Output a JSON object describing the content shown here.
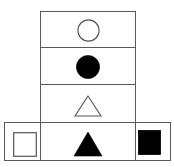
{
  "figure": {
    "canvas": {
      "width": 174,
      "height": 167,
      "background": "#ffffff"
    },
    "stroke_color": "#5a5a5a",
    "shape_outline_color": "#555555",
    "shape_fill_color": "#000000",
    "column": {
      "name": "vertical-column",
      "cells": [
        {
          "index": 1,
          "shape": "circle-outline-icon",
          "label": "open circle",
          "fill": "none",
          "outline": "#555555"
        },
        {
          "index": 2,
          "shape": "circle-filled-icon",
          "label": "filled circle",
          "fill": "#000000",
          "outline": "#000000"
        },
        {
          "index": 3,
          "shape": "triangle-outline-icon",
          "label": "open triangle",
          "fill": "none",
          "outline": "#555555"
        },
        {
          "index": 4,
          "shape": "triangle-filled-icon",
          "label": "filled triangle",
          "fill": "#000000",
          "outline": "#000000"
        }
      ]
    },
    "row": {
      "name": "horizontal-row",
      "cells": [
        {
          "index": 1,
          "shape": "square-outline-icon",
          "label": "open square",
          "fill": "none",
          "outline": "#555555"
        },
        {
          "index": 2,
          "shape": "triangle-filled-icon",
          "label": "filled triangle",
          "fill": "#000000",
          "outline": "#000000"
        },
        {
          "index": 3,
          "shape": "square-filled-icon",
          "label": "filled square",
          "fill": "#000000",
          "outline": "#000000"
        }
      ]
    }
  }
}
